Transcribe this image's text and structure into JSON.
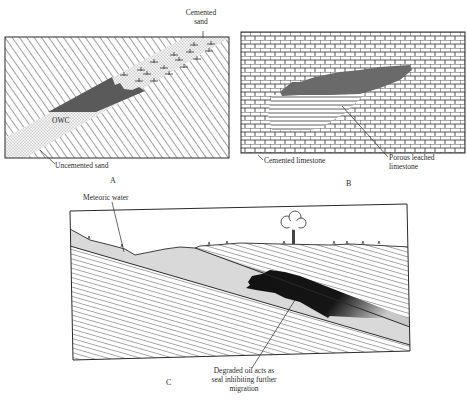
{
  "figure": {
    "panels": [
      {
        "id": "A",
        "letter": "A",
        "labels": {
          "cemented_sand": [
            "Cemented",
            "sand"
          ],
          "owc": "OWC",
          "uncemented_sand": "Uncemented sand"
        }
      },
      {
        "id": "B",
        "letter": "B",
        "labels": {
          "cemented_limestone": "Cemented limestone",
          "porous_leached_limestone": [
            "Porous leached",
            "limestone"
          ]
        }
      },
      {
        "id": "C",
        "letter": "C",
        "labels": {
          "meteoric_water": "Meteoric water",
          "degraded_oil": [
            "Degraded oil acts as",
            "seal inhibiting further",
            "migration"
          ]
        }
      }
    ],
    "colors": {
      "line": "#2a2a2a",
      "oil_dark": "#1a1a1a",
      "oil_mid": "#555555",
      "sand": "#d9d9d9",
      "background": "#ffffff"
    }
  }
}
